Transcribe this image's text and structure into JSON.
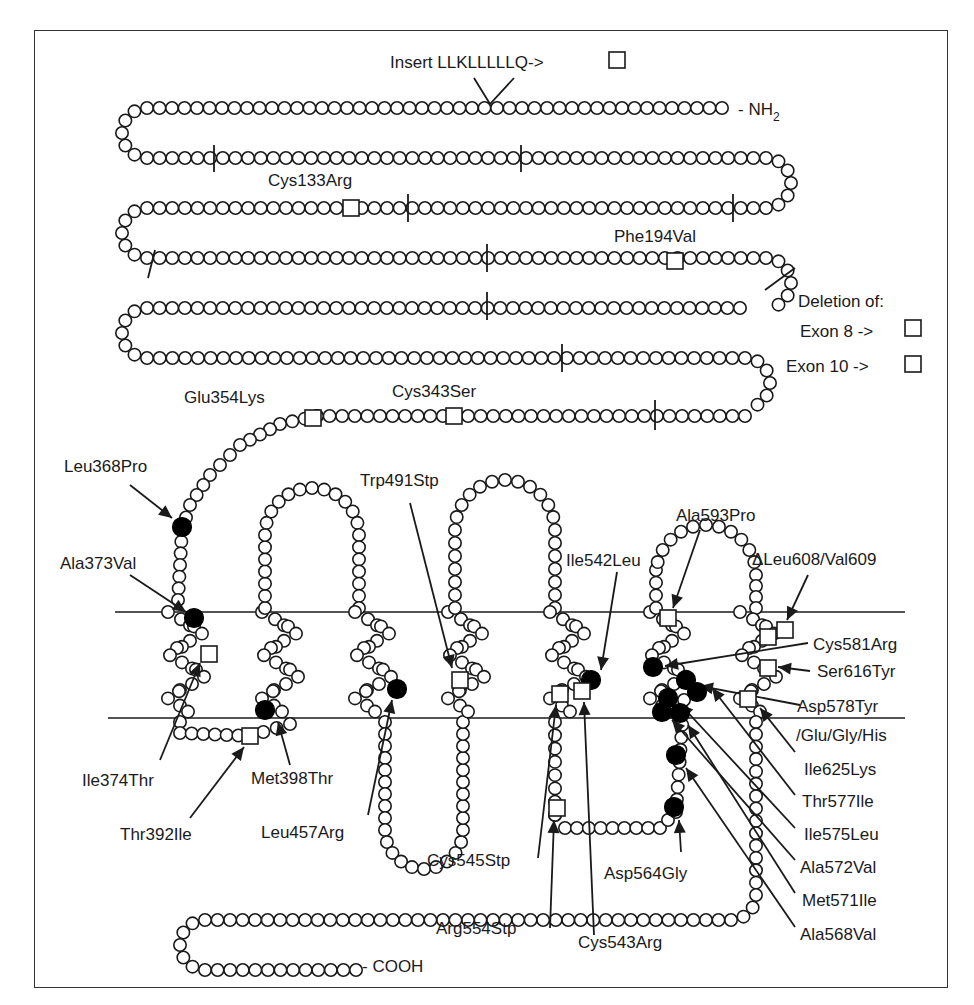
{
  "figure": {
    "type": "protein-topology-diagram",
    "colors": {
      "line": "#1a1a1a",
      "background": "#ffffff",
      "missense_marker": "#000000"
    },
    "termini": {
      "n_terminus": "- NH",
      "n_sub": "2",
      "c_terminus": "- COOH"
    },
    "insertion": {
      "label": "Insert LLKLLLLLQ->"
    },
    "deletion_legend": {
      "title": "Deletion of:",
      "items": [
        {
          "label": "Exon 8 ->"
        },
        {
          "label": "Exon 10 ->"
        }
      ]
    },
    "mutations": {
      "cytoplasmic_tail": [
        {
          "label": "Cys133Arg",
          "marker": "square"
        },
        {
          "label": "Phe194Val",
          "marker": "square"
        },
        {
          "label": "Cys343Ser",
          "marker": "square"
        },
        {
          "label": "Glu354Lys",
          "marker": "square"
        },
        {
          "label": "Leu368Pro",
          "marker": "filled-circle"
        }
      ],
      "transmembrane": [
        {
          "label": "Ala373Val",
          "marker": "filled-circle"
        },
        {
          "label": "Ile374Thr",
          "marker": "square"
        },
        {
          "label": "Thr392Ile",
          "marker": "square"
        },
        {
          "label": "Met398Thr",
          "marker": "filled-circle"
        },
        {
          "label": "Leu457Arg",
          "marker": "filled-circle"
        },
        {
          "label": "Trp491Stp",
          "marker": "square"
        },
        {
          "label": "Ile542Leu",
          "marker": "filled-circle"
        },
        {
          "label": "Cys545Stp",
          "marker": "square"
        },
        {
          "label": "Cys543Arg",
          "marker": "square"
        },
        {
          "label": "Arg554Stp",
          "marker": "square"
        },
        {
          "label": "Asp564Gly",
          "marker": "filled-circle"
        },
        {
          "label": "Ala593Pro",
          "marker": "square"
        },
        {
          "label": "ΔLeu608/Val609",
          "marker": "square"
        },
        {
          "label": "Cys581Arg",
          "marker": "filled-circle"
        },
        {
          "label": "Ser616Tyr",
          "marker": "square"
        },
        {
          "label": "Asp578Tyr",
          "marker": "filled-circle"
        },
        {
          "label": "/Glu/Gly/His",
          "marker": "continuation"
        },
        {
          "label": "Ile625Lys",
          "marker": "square"
        },
        {
          "label": "Thr577Ile",
          "marker": "filled-circle"
        },
        {
          "label": "Ile575Leu",
          "marker": "filled-circle"
        },
        {
          "label": "Ala572Val",
          "marker": "filled-circle"
        },
        {
          "label": "Met571Ile",
          "marker": "filled-circle"
        },
        {
          "label": "Ala568Val",
          "marker": "filled-circle"
        }
      ]
    }
  }
}
